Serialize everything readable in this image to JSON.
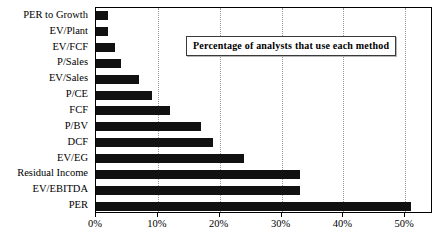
{
  "chart_data": {
    "type": "bar",
    "orientation": "horizontal",
    "title": "Percentage of analysts that use each method",
    "xlabel": "",
    "ylabel": "",
    "categories": [
      "PER to Growth",
      "EV/Plant",
      "EV/FCF",
      "P/Sales",
      "EV/Sales",
      "P/CE",
      "FCF",
      "P/BV",
      "DCF",
      "EV/EG",
      "Residual Income",
      "EV/EBITDA",
      "PER"
    ],
    "values": [
      2,
      2,
      3,
      4,
      7,
      9,
      12,
      17,
      19,
      24,
      33,
      33,
      51
    ],
    "value_unit": "%",
    "xlim": [
      0,
      54.5
    ],
    "xticks": [
      0,
      10,
      20,
      30,
      40,
      50
    ],
    "xtick_labels": [
      "0%",
      "10%",
      "20%",
      "30%",
      "40%",
      "50%"
    ],
    "grid": "vertical-dotted",
    "legend": "none",
    "bar_color": "#111111",
    "plot_border_color": "#000000",
    "gridline_color": "#9a9a9a",
    "background_color": "#ffffff"
  },
  "legend_box": {
    "text": "Percentage of analysts that use each method"
  }
}
